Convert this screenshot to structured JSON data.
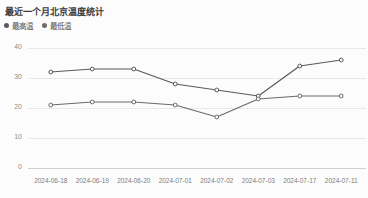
{
  "chart_title": "最近一个月北京温度统计",
  "legend": {
    "position": "top-left",
    "items": [
      {
        "label": "最高温",
        "color": "#5a5a5a",
        "marker": "legend-dot-icon"
      },
      {
        "label": "最低温",
        "color": "#6b6b6b",
        "marker": "legend-dot-icon"
      }
    ]
  },
  "chart_data": {
    "type": "line",
    "title": "最近一个月北京温度统计",
    "xlabel": "",
    "ylabel": "",
    "ylim": [
      0,
      40
    ],
    "yticks": [
      0,
      10,
      20,
      30,
      40
    ],
    "ytick_labels": [
      "0",
      "10",
      "20",
      "30",
      "40"
    ],
    "grid": true,
    "legend_position": "top-left",
    "categories": [
      "2024-06-18",
      "2024-06-19",
      "2024-06-20",
      "2024-07-01",
      "2024-07-02",
      "2024-07-03",
      "2024-07-17",
      "2024-07-11"
    ],
    "x": [
      "2024-06-18",
      "2024-06-19",
      "2024-06-20",
      "2024-07-01",
      "2024-07-02",
      "2024-07-03",
      "2024-07-17",
      "2024-07-11"
    ],
    "series": [
      {
        "name": "最高温",
        "color": "#5a5a5a",
        "values": [
          32,
          33,
          33,
          28,
          26,
          24,
          34,
          36
        ]
      },
      {
        "name": "最低温",
        "color": "#6b6b6b",
        "values": [
          21,
          22,
          22,
          21,
          17,
          23,
          24,
          24
        ]
      }
    ]
  },
  "axes": {
    "y_ticks": [
      "40",
      "30",
      "20",
      "10",
      "0"
    ],
    "x_ticks": [
      "2024-06-18",
      "2024-06-19",
      "2024-06-20",
      "2024-07-01",
      "2024-07-02",
      "2024-07-03",
      "2024-07-17",
      "2024-07-11"
    ]
  },
  "colors": {
    "background": "#fcfcfc",
    "grid": "#e8e8e8",
    "axis_text": "#8c8c8c",
    "title_text": "#3a3a3a",
    "series_high": "#5a5a5a",
    "series_low": "#6b6b6b"
  }
}
